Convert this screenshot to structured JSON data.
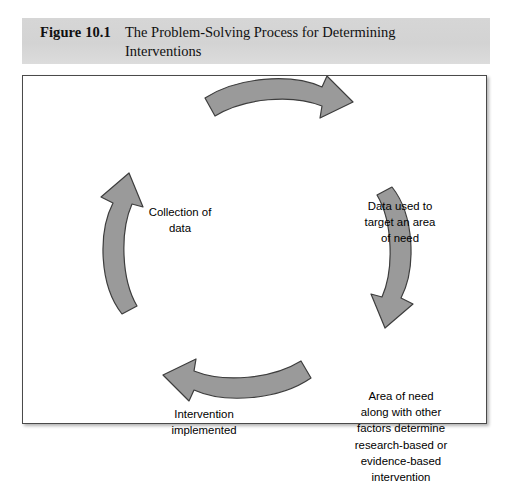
{
  "caption": {
    "figure_number": "Figure 10.1",
    "title": "The Problem-Solving Process for Determining Interventions"
  },
  "diagram": {
    "type": "cycle",
    "direction": "clockwise",
    "nodes": [
      {
        "id": "collection-of-data",
        "text": "Collection of\ndata"
      },
      {
        "id": "data-used-to-target",
        "text": "Data used to\ntarget an area\nof need"
      },
      {
        "id": "area-of-need-factors",
        "text": "Area of need\nalong with other\nfactors determine\nresearch-based or\nevidence-based\nintervention"
      },
      {
        "id": "intervention-implemented",
        "text": "Intervention\nimplemented"
      }
    ],
    "arrows": [
      {
        "id": "arrow-top",
        "points_to": "data-used-to-target",
        "direction": "right"
      },
      {
        "id": "arrow-right",
        "points_to": "area-of-need-factors",
        "direction": "down"
      },
      {
        "id": "arrow-bottom",
        "points_to": "intervention-implemented",
        "direction": "left"
      },
      {
        "id": "arrow-left",
        "points_to": "collection-of-data",
        "direction": "up"
      }
    ]
  },
  "colors": {
    "caption_band": "#d4d4d4",
    "arrow_fill": "#9a9a9a",
    "arrow_stroke": "#3d3d3d",
    "panel_border": "#4a4a4a",
    "text": "#000000"
  }
}
